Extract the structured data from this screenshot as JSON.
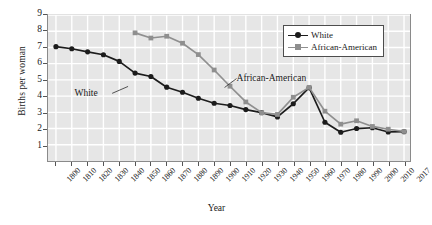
{
  "chart_data": {
    "type": "line",
    "title": "",
    "xlabel": "Year",
    "ylabel": "Births per woman",
    "grid": true,
    "legend_position": "top-right",
    "xlim": [
      1800,
      2017
    ],
    "ylim": [
      0,
      9
    ],
    "yticks": [
      1,
      2,
      3,
      4,
      5,
      6,
      7,
      8,
      9
    ],
    "xticks": [
      "1800",
      "1810",
      "1820",
      "1830",
      "1840",
      "1850",
      "1860",
      "1870",
      "1880",
      "1890",
      "1900",
      "1910",
      "1920",
      "1930",
      "1940",
      "1950",
      "1960",
      "1970",
      "1980",
      "1990",
      "2000",
      "2010",
      "2017"
    ],
    "x": [
      1800,
      1810,
      1820,
      1830,
      1840,
      1850,
      1860,
      1870,
      1880,
      1890,
      1900,
      1910,
      1920,
      1930,
      1940,
      1950,
      1960,
      1970,
      1980,
      1990,
      2000,
      2010,
      2017
    ],
    "series": [
      {
        "name": "White",
        "color": "#1c1c1c",
        "marker": "circle",
        "x": [
          1800,
          1810,
          1820,
          1830,
          1840,
          1850,
          1860,
          1870,
          1880,
          1890,
          1900,
          1910,
          1920,
          1930,
          1940,
          1950,
          1960,
          1970,
          1980,
          1990,
          2000,
          2010,
          2017
        ],
        "values": [
          7.05,
          6.92,
          6.73,
          6.55,
          6.14,
          5.42,
          5.21,
          4.55,
          4.24,
          3.87,
          3.56,
          3.42,
          3.17,
          2.98,
          2.72,
          3.53,
          4.52,
          2.39,
          1.77,
          2.0,
          2.05,
          1.79,
          1.81
        ]
      },
      {
        "name": "African-American",
        "color": "#8f8f8f",
        "marker": "square",
        "x": [
          1850,
          1860,
          1870,
          1880,
          1890,
          1900,
          1910,
          1920,
          1930,
          1940,
          1950,
          1960,
          1970,
          1980,
          1990,
          2000,
          2010,
          2017
        ],
        "values": [
          7.9,
          7.58,
          7.69,
          7.26,
          6.56,
          5.61,
          4.61,
          3.64,
          2.98,
          2.87,
          3.93,
          4.54,
          3.07,
          2.27,
          2.48,
          2.13,
          1.96,
          1.82
        ]
      }
    ],
    "annotations": [
      {
        "text": "White",
        "x": 1833,
        "y": 4.17
      },
      {
        "text": "African-American",
        "x": 1916,
        "y": 5.08
      }
    ]
  },
  "legend": {
    "items": [
      {
        "label": "White",
        "color": "#1c1c1c",
        "marker": "circle"
      },
      {
        "label": "African-American",
        "color": "#8f8f8f",
        "marker": "square"
      }
    ]
  }
}
